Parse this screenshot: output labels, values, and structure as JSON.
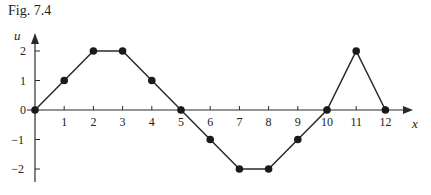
{
  "figure": {
    "title": "Fig. 7.4"
  },
  "chart_data": {
    "type": "line",
    "title": "Fig. 7.4",
    "xlabel": "x",
    "ylabel": "u",
    "x": [
      0,
      1,
      2,
      3,
      4,
      5,
      6,
      7,
      8,
      9,
      10,
      11,
      12
    ],
    "series": [
      {
        "name": "u",
        "values": [
          0,
          1,
          2,
          2,
          1,
          0,
          -1,
          -2,
          -2,
          -1,
          0,
          2,
          0
        ]
      }
    ],
    "x_ticks": [
      "1",
      "2",
      "3",
      "4",
      "5",
      "6",
      "7",
      "8",
      "9",
      "10",
      "11",
      "12"
    ],
    "y_ticks": [
      "2",
      "1",
      "0",
      "-1",
      "-2"
    ],
    "y_tick_values": [
      2,
      1,
      0,
      -1,
      -2
    ],
    "xlim": [
      0,
      12.8
    ],
    "ylim": [
      -2.5,
      2.7
    ],
    "grid": false,
    "markers": true
  }
}
